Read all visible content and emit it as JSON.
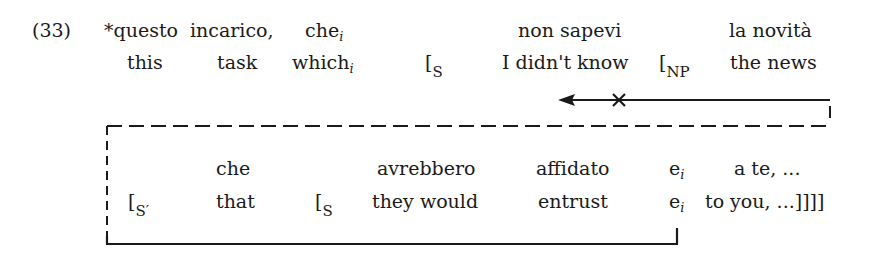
{
  "example": {
    "number": "(33)",
    "row1": {
      "w1": "*questo",
      "w2": "incarico,",
      "w3": "che",
      "w3_index": "i",
      "w4": "non sapevi",
      "w5": "la novità"
    },
    "row2": {
      "w1": "this",
      "w2": "task",
      "w3": "which",
      "w3_index": "i",
      "b1": "[",
      "b1_label": "S",
      "w4": "I didn't know",
      "b2": "[",
      "b2_label": "NP",
      "w5": "the news"
    },
    "row3": {
      "w1": "che",
      "w2": "avrebbero",
      "w3": "affidato",
      "w4": "e",
      "w4_index": "i",
      "w5": "a te, ..."
    },
    "row4": {
      "b1": "[",
      "b1_label": "S′",
      "w1": "that",
      "b2": "[",
      "b2_label": "S",
      "w2": "they would",
      "w3": "entrust",
      "w4": "e",
      "w4_index": "i",
      "w5": "to you, ...]]]]"
    },
    "annotations": {
      "blocked_movement_mark": "×",
      "arrow_direction": "left"
    }
  }
}
